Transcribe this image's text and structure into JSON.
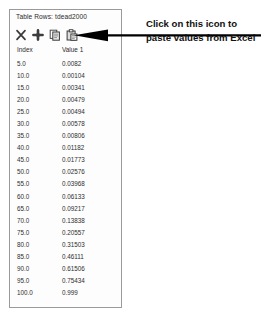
{
  "panel": {
    "title": "Table Rows: tdead2000",
    "toolbar": {
      "icons": [
        {
          "name": "delete-row-icon",
          "label": "Delete"
        },
        {
          "name": "add-row-icon",
          "label": "Add"
        },
        {
          "name": "copy-icon",
          "label": "Copy"
        },
        {
          "name": "paste-icon",
          "label": "Paste"
        }
      ]
    },
    "columns": [
      "Index",
      "Value 1"
    ],
    "rows": [
      {
        "index": "5.0",
        "value1": "0.0082"
      },
      {
        "index": "10.0",
        "value1": "0.00104"
      },
      {
        "index": "15.0",
        "value1": "0.00341"
      },
      {
        "index": "20.0",
        "value1": "0.00479"
      },
      {
        "index": "25.0",
        "value1": "0.00494"
      },
      {
        "index": "30.0",
        "value1": "0.00578"
      },
      {
        "index": "35.0",
        "value1": "0.00806"
      },
      {
        "index": "40.0",
        "value1": "0.01182"
      },
      {
        "index": "45.0",
        "value1": "0.01773"
      },
      {
        "index": "50.0",
        "value1": "0.02576"
      },
      {
        "index": "55.0",
        "value1": "0.03968"
      },
      {
        "index": "60.0",
        "value1": "0.06133"
      },
      {
        "index": "65.0",
        "value1": "0.09217"
      },
      {
        "index": "70.0",
        "value1": "0.13838"
      },
      {
        "index": "75.0",
        "value1": "0.20557"
      },
      {
        "index": "80.0",
        "value1": "0.31503"
      },
      {
        "index": "85.0",
        "value1": "0.46111"
      },
      {
        "index": "90.0",
        "value1": "0.61506"
      },
      {
        "index": "95.0",
        "value1": "0.75434"
      },
      {
        "index": "100.0",
        "value1": "0.999"
      }
    ]
  },
  "annotation": {
    "text": "Click on this icon to paste values from Excel",
    "arrow_name": "annotation-arrow",
    "arrow_color": "#000000"
  },
  "bottom_caption": {
    "text": ""
  },
  "colors": {
    "panel_border": "#9a9a9a",
    "text": "#2b2b2b",
    "annotation": "#111111"
  }
}
